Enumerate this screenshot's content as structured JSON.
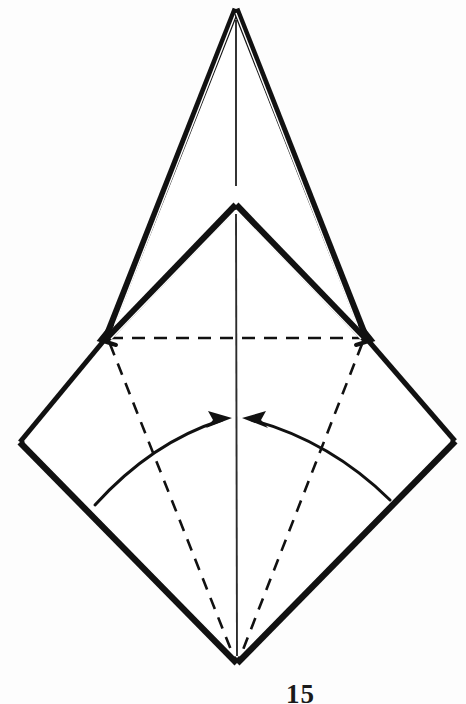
{
  "figure": {
    "number_label": "15",
    "caption": "",
    "background_color": "#fdfdfd",
    "ink_color": "#111111"
  },
  "diagram": {
    "type": "origami-fold-step",
    "instruction": "Fold the two lower side corners inward to the vertical center line",
    "canvas": {
      "width": 466,
      "height": 704
    },
    "colors": {
      "solid_edge": "#111111",
      "crease_dashed": "#111111",
      "arrow": "#111111",
      "center_line": "#333333",
      "paper_fill": "#ffffff"
    },
    "points": {
      "outer_apex": [
        236,
        9
      ],
      "inner_apex": [
        236,
        205
      ],
      "left_shoulder": [
        106,
        338
      ],
      "right_shoulder": [
        366,
        338
      ],
      "left_corner": [
        20,
        442
      ],
      "right_corner": [
        455,
        441
      ],
      "bottom_vertex": [
        237,
        663
      ]
    },
    "shapes": [
      {
        "name": "outer-triangle",
        "kind": "solid-double-line",
        "vertices": [
          [
            236,
            9
          ],
          [
            366,
            338
          ],
          [
            106,
            338
          ]
        ]
      },
      {
        "name": "inner-triangle",
        "kind": "solid-double-line",
        "vertices": [
          [
            236,
            205
          ],
          [
            366,
            338
          ],
          [
            106,
            338
          ]
        ]
      },
      {
        "name": "lower-diamond",
        "kind": "solid-double-line",
        "vertices": [
          [
            106,
            338
          ],
          [
            20,
            442
          ],
          [
            237,
            663
          ],
          [
            455,
            441
          ],
          [
            366,
            338
          ]
        ]
      }
    ],
    "creases": [
      {
        "name": "horizontal-crease",
        "style": "dashed",
        "from": [
          110,
          338
        ],
        "to": [
          362,
          338
        ]
      },
      {
        "name": "left-diagonal-crease",
        "style": "dashed",
        "from": [
          110,
          345
        ],
        "to": [
          235,
          660
        ]
      },
      {
        "name": "right-diagonal-crease",
        "style": "dashed",
        "from": [
          362,
          345
        ],
        "to": [
          239,
          660
        ]
      }
    ],
    "center_line": {
      "name": "vertical-center-line",
      "style": "thin-solid",
      "segments": [
        {
          "from": [
            236,
            20
          ],
          "to": [
            236,
            185
          ]
        },
        {
          "from": [
            236,
            215
          ],
          "to": [
            237,
            655
          ]
        }
      ]
    },
    "arrows": [
      {
        "name": "left-fold-arrow",
        "direction": "right",
        "curve_start": [
          95,
          505
        ],
        "curve_control": [
          150,
          445
        ],
        "curve_end": [
          228,
          419
        ],
        "head_at": [
          230,
          419
        ]
      },
      {
        "name": "right-fold-arrow",
        "direction": "left",
        "curve_start": [
          390,
          500
        ],
        "curve_control": [
          330,
          443
        ],
        "curve_end": [
          248,
          419
        ],
        "head_at": [
          246,
          419
        ]
      }
    ]
  }
}
